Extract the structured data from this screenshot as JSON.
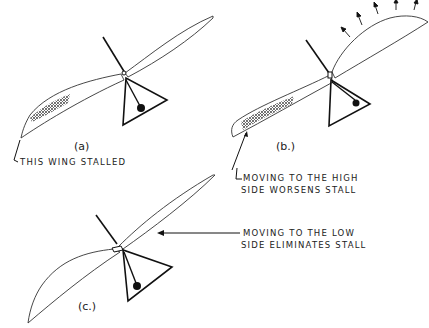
{
  "diagram": {
    "panels": [
      {
        "id": "a",
        "caption": "(a)",
        "annotation": [
          "THIS WING STALLED"
        ]
      },
      {
        "id": "b",
        "caption": "(b.)",
        "annotation": [
          "MOVING TO THE HIGH",
          "SIDE WORSENS STALL"
        ]
      },
      {
        "id": "c",
        "caption": "(c.)",
        "annotation": [
          "MOVING TO THE LOW",
          "SIDE ELIMINATES STALL"
        ]
      }
    ],
    "colors": {
      "ink": "#222222",
      "background": "#ffffff"
    }
  }
}
